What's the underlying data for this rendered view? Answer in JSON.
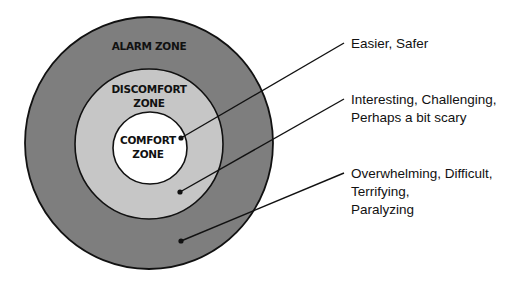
{
  "diagram": {
    "type": "concentric-circles",
    "colors": {
      "alarm_fill": "#7e7e7e",
      "discomfort_fill": "#c6c6c6",
      "comfort_fill": "#ffffff",
      "stroke": "#111111"
    },
    "zones": [
      {
        "id": "alarm",
        "label_lines": [
          "ALARM ZONE"
        ]
      },
      {
        "id": "discomfort",
        "label_lines": [
          "DISCOMFORT",
          "ZONE"
        ]
      },
      {
        "id": "comfort",
        "label_lines": [
          "COMFORT",
          "ZONE"
        ]
      }
    ],
    "callouts": [
      {
        "zone": "comfort",
        "lines": [
          "Easier, Safer"
        ]
      },
      {
        "zone": "discomfort",
        "lines": [
          "Interesting, Challenging,",
          "Perhaps a bit scary"
        ]
      },
      {
        "zone": "alarm",
        "lines": [
          "Overwhelming, Difficult,",
          "Terrifying,",
          "Paralyzing"
        ]
      }
    ]
  }
}
